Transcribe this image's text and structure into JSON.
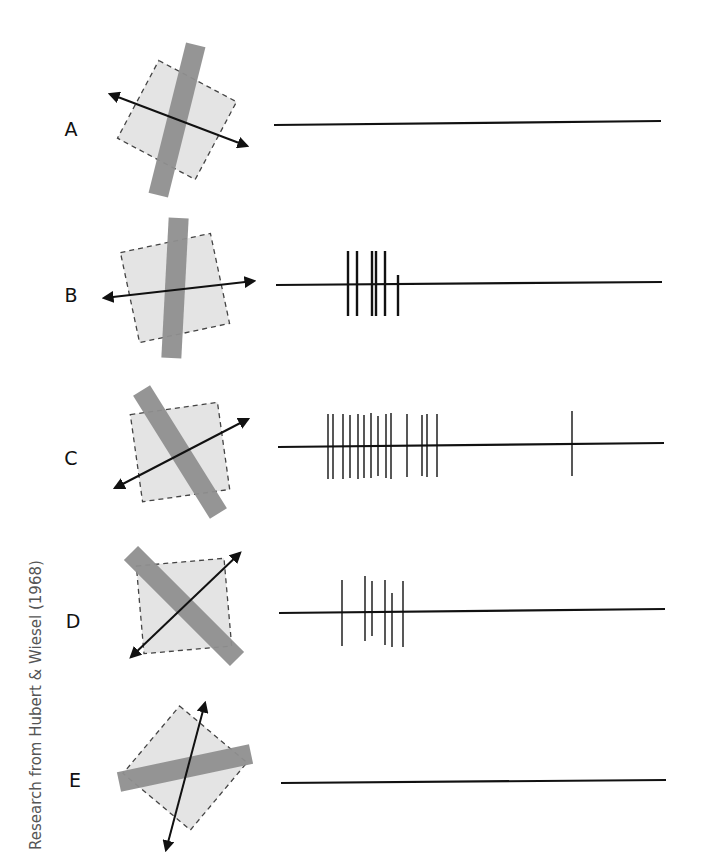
{
  "figure": {
    "credit": "Research from Hubert & Wiesel (1968)",
    "colors": {
      "bar": "#8f8f8f",
      "receptive_field": "#e4e4e4",
      "field_border": "#444444",
      "arrow": "#111111",
      "trace": "#111111"
    },
    "rows": [
      {
        "label": "A",
        "label_pos": [
          71,
          136
        ],
        "field": {
          "cx": 177,
          "cy": 120,
          "size": 88,
          "angle": 28
        },
        "bar": {
          "angle": 14,
          "length": 155,
          "width": 20
        },
        "arrow": {
          "x1": 110,
          "y1": 94,
          "x2": 247,
          "y2": 146
        },
        "trace": {
          "x1": 274,
          "y1": 125,
          "x2": 661,
          "y2": 121
        },
        "spikes": []
      },
      {
        "label": "B",
        "label_pos": [
          71,
          302
        ],
        "field": {
          "cx": 175,
          "cy": 288,
          "size": 92,
          "angle": -12
        },
        "bar": {
          "angle": 3,
          "length": 140,
          "width": 20
        },
        "arrow": {
          "x1": 104,
          "y1": 298,
          "x2": 254,
          "y2": 281
        },
        "trace": {
          "x1": 276,
          "y1": 285,
          "x2": 662,
          "y2": 282
        },
        "spikes": [
          {
            "x": 348,
            "top": 251,
            "bottom": 316
          },
          {
            "x": 357,
            "top": 251,
            "bottom": 316
          },
          {
            "x": 372,
            "top": 251,
            "bottom": 316
          },
          {
            "x": 376,
            "top": 251,
            "bottom": 316
          },
          {
            "x": 385,
            "top": 251,
            "bottom": 316
          },
          {
            "x": 398,
            "top": 275,
            "bottom": 316
          }
        ]
      },
      {
        "label": "C",
        "label_pos": [
          71,
          465
        ],
        "field": {
          "cx": 180,
          "cy": 452,
          "size": 88,
          "angle": -8
        },
        "bar": {
          "angle": -32,
          "length": 145,
          "width": 20
        },
        "arrow": {
          "x1": 115,
          "y1": 488,
          "x2": 248,
          "y2": 419
        },
        "trace": {
          "x1": 278,
          "y1": 447,
          "x2": 664,
          "y2": 443
        },
        "spikes": [
          {
            "x": 328,
            "top": 414,
            "bottom": 479
          },
          {
            "x": 333,
            "top": 414,
            "bottom": 479
          },
          {
            "x": 343,
            "top": 414,
            "bottom": 479
          },
          {
            "x": 350,
            "top": 415,
            "bottom": 478
          },
          {
            "x": 358,
            "top": 414,
            "bottom": 479
          },
          {
            "x": 364,
            "top": 415,
            "bottom": 478
          },
          {
            "x": 371,
            "top": 413,
            "bottom": 478
          },
          {
            "x": 378,
            "top": 416,
            "bottom": 476
          },
          {
            "x": 386,
            "top": 414,
            "bottom": 478
          },
          {
            "x": 391,
            "top": 413,
            "bottom": 479
          },
          {
            "x": 407,
            "top": 414,
            "bottom": 477
          },
          {
            "x": 422,
            "top": 415,
            "bottom": 476
          },
          {
            "x": 427,
            "top": 414,
            "bottom": 477
          },
          {
            "x": 437,
            "top": 414,
            "bottom": 477
          },
          {
            "x": 572,
            "top": 411,
            "bottom": 476
          }
        ]
      },
      {
        "label": "D",
        "label_pos": [
          73,
          628
        ],
        "field": {
          "cx": 184,
          "cy": 606,
          "size": 88,
          "angle": -5
        },
        "bar": {
          "angle": -45,
          "length": 150,
          "width": 20
        },
        "arrow": {
          "x1": 131,
          "y1": 657,
          "x2": 240,
          "y2": 553
        },
        "trace": {
          "x1": 279,
          "y1": 613,
          "x2": 665,
          "y2": 609
        },
        "spikes": [
          {
            "x": 342,
            "top": 580,
            "bottom": 646
          },
          {
            "x": 365,
            "top": 576,
            "bottom": 641
          },
          {
            "x": 372,
            "top": 581,
            "bottom": 636
          },
          {
            "x": 385,
            "top": 580,
            "bottom": 645
          },
          {
            "x": 392,
            "top": 593,
            "bottom": 647
          },
          {
            "x": 403,
            "top": 581,
            "bottom": 647
          }
        ]
      },
      {
        "label": "E",
        "label_pos": [
          75,
          787
        ],
        "field": {
          "cx": 185,
          "cy": 768,
          "size": 88,
          "angle": 40
        },
        "bar": {
          "angle": 78,
          "length": 135,
          "width": 20
        },
        "arrow": {
          "x1": 166,
          "y1": 850,
          "x2": 205,
          "y2": 703
        },
        "trace": {
          "x1": 281,
          "y1": 783,
          "x2": 666,
          "y2": 780
        },
        "spikes": []
      }
    ]
  }
}
